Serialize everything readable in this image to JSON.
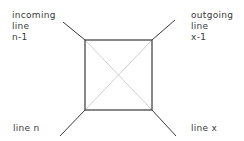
{
  "diagram": {
    "labels": {
      "incoming": [
        "incoming",
        "line",
        "n-1"
      ],
      "outgoing": [
        "outgoing",
        "line",
        "x-1"
      ],
      "bottom_left": "line n",
      "bottom_right": "line x"
    },
    "colors": {
      "stroke": "#3a3a3a",
      "diagonal": "#d0d0d0",
      "background": "#ffffff"
    }
  }
}
